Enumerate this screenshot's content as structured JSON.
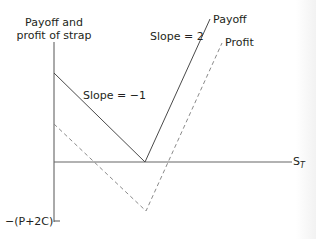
{
  "diagram": {
    "title_line1": "Payoff and",
    "title_line2": "profit of strap",
    "slope_left_label": "Slope = −1",
    "slope_right_label": "Slope = 2",
    "payoff_label": "Payoff",
    "profit_label": "Profit",
    "x_axis_label": "S",
    "x_axis_subscript": "T",
    "y_min_label": "−(P+2C)",
    "colors": {
      "payoff_line": "#4a4a4a",
      "profit_line": "#8a8a8a",
      "axes": "#555555",
      "text": "#231f20"
    }
  }
}
